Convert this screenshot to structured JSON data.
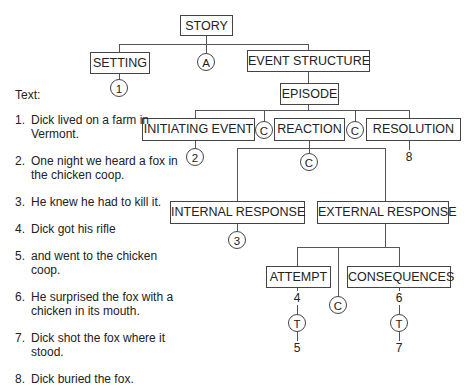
{
  "diagram": {
    "nodes": {
      "story": "STORY",
      "setting": "SETTING",
      "event_structure": "EVENT STRUCTURE",
      "episode": "EPISODE",
      "initiating_event": "INITIATING EVENT",
      "reaction": "REACTION",
      "resolution": "RESOLUTION",
      "internal_response": "INTERNAL RESPONSE",
      "external_response": "EXTERNAL RESPONSE",
      "attempt": "ATTEMPT",
      "consequences": "CONSEQUENCES"
    },
    "markers": {
      "setting_ref": "1",
      "story_and": "A",
      "initiating_ref": "2",
      "episode_c1": "C",
      "episode_c2": "C",
      "resolution_ref": "8",
      "reaction_c": "C",
      "internal_ref": "3",
      "external_c": "C",
      "attempt_top": "4",
      "attempt_t": "T",
      "attempt_bottom": "5",
      "consequences_top": "6",
      "consequences_t": "T",
      "consequences_bottom": "7"
    }
  },
  "text_panel": {
    "heading": "Text:",
    "items": [
      {
        "n": "1.",
        "t": "Dick lived on a farm in Vermont."
      },
      {
        "n": "2.",
        "t": "One night we heard a fox in the chicken coop."
      },
      {
        "n": "3.",
        "t": "He knew he had to kill it."
      },
      {
        "n": "4.",
        "t": "Dick got his rifle"
      },
      {
        "n": "5.",
        "t": "and went to the chicken coop."
      },
      {
        "n": "6.",
        "t": "He surprised the fox with a chicken in its mouth."
      },
      {
        "n": "7.",
        "t": "Dick shot the fox where it stood."
      },
      {
        "n": "8.",
        "t": "Dick buried the fox."
      }
    ]
  }
}
